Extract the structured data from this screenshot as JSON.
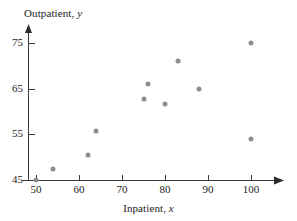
{
  "chart_data": {
    "type": "scatter",
    "title": "",
    "xlabel": "Inpatient, x",
    "ylabel": "Outpatient, y",
    "xlim": [
      47,
      108
    ],
    "ylim": [
      43.5,
      78
    ],
    "xticks": [
      50,
      60,
      70,
      80,
      90,
      100
    ],
    "yticks": [
      45,
      55,
      65,
      75
    ],
    "xtick_labels": [
      "50",
      "60",
      "70",
      "80",
      "90",
      "100"
    ],
    "ytick_labels": [
      "45",
      "55",
      "65",
      "75"
    ],
    "grid": false,
    "legend": null,
    "marker_color": "#8d8d8d",
    "axis_color": "#3a3a3a",
    "points": [
      {
        "x": 50,
        "y": 45.0
      },
      {
        "x": 54,
        "y": 47.4
      },
      {
        "x": 62,
        "y": 50.5
      },
      {
        "x": 64,
        "y": 55.7
      },
      {
        "x": 75,
        "y": 62.7
      },
      {
        "x": 76,
        "y": 66.0
      },
      {
        "x": 80,
        "y": 61.7
      },
      {
        "x": 83,
        "y": 71.0
      },
      {
        "x": 88,
        "y": 64.9
      },
      {
        "x": 100,
        "y": 75.0
      },
      {
        "x": 100,
        "y": 54.0
      }
    ]
  },
  "labels": {
    "y_axis_name": "Outpatient,",
    "y_axis_var": "y",
    "x_axis_name": "Inpatient,",
    "x_axis_var": "x"
  }
}
